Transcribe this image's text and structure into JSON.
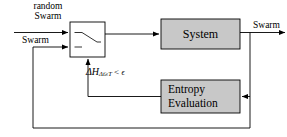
{
  "diagram": {
    "background_color": "#ffffff",
    "line_color": "#000000",
    "block_fill_color": "#c8c8c8",
    "block_stroke_color": "#000000",
    "blocks": [
      {
        "id": "switch",
        "name": "switch-selector-block",
        "label": "",
        "x": 70,
        "y": 22,
        "width": 35,
        "height": 35,
        "fill": "#ffffff"
      },
      {
        "id": "system",
        "name": "system-block",
        "label": "System",
        "x": 161,
        "y": 19,
        "width": 79,
        "height": 30,
        "fill": "#c8c8c8"
      },
      {
        "id": "entropy",
        "name": "entropy-evaluation-block",
        "label_line1": "Entropy",
        "label_line2": "Evaluation",
        "x": 161,
        "y": 80,
        "width": 79,
        "height": 33,
        "fill": "#c8c8c8"
      }
    ],
    "labels": {
      "random_swarm_line1": "random",
      "random_swarm_line2": "Swarm",
      "swarm_input": "Swarm",
      "swarm_output": "Swarm",
      "system": "System",
      "entropy_line1": "Entropy",
      "entropy_line2": "Evaluation",
      "condition_delta": "ΔH",
      "condition_subscript": "Δt≥T",
      "condition_relation": "<",
      "condition_epsilon": "ϵ"
    },
    "signals": [
      {
        "name": "random-swarm-input-arrow",
        "from": "left-edge",
        "to": "switch-top-terminal"
      },
      {
        "name": "swarm-feedback-input-arrow",
        "from": "feedback-bus",
        "to": "switch-bottom-terminal"
      },
      {
        "name": "switch-to-system-arrow",
        "from": "switch",
        "to": "system"
      },
      {
        "name": "system-to-output-arrow",
        "from": "system",
        "to": "swarm-output"
      },
      {
        "name": "output-to-entropy-arrow",
        "from": "swarm-output-tap",
        "to": "entropy-evaluation"
      },
      {
        "name": "entropy-to-switch-arrow",
        "from": "entropy-evaluation",
        "to": "switch-bottom-control"
      },
      {
        "name": "outer-feedback-loop",
        "from": "swarm-output-tap",
        "to": "switch-lower-input"
      }
    ]
  }
}
